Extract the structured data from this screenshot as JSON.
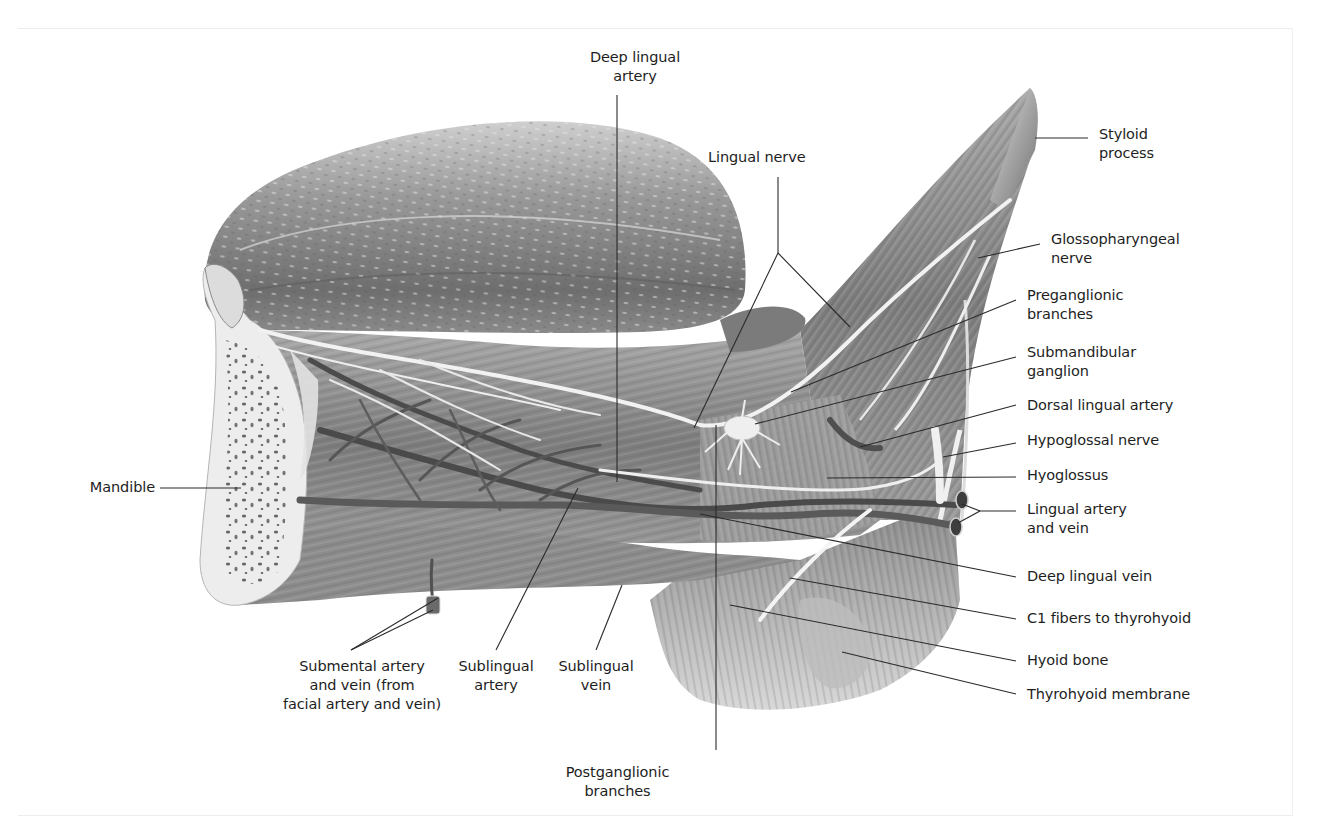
{
  "figure": {
    "colors": {
      "background": "#ffffff",
      "text": "#1e1e1e",
      "leader": "#2a2a2a"
    }
  },
  "labels": {
    "deep_lingual_artery": {
      "text": "Deep lingual\nartery",
      "x": 560,
      "y": 48,
      "align": "center",
      "w": 150
    },
    "lingual_nerve": {
      "text": "Lingual nerve",
      "x": 708,
      "y": 148,
      "align": "left",
      "w": 130
    },
    "styloid_process": {
      "text": "Styloid\nprocess",
      "x": 1099,
      "y": 125,
      "align": "left",
      "w": 120
    },
    "glossopharyngeal_nerve": {
      "text": "Glossopharyngeal\nnerve",
      "x": 1051,
      "y": 230,
      "align": "left",
      "w": 180
    },
    "preganglionic_branches": {
      "text": "Preganglionic\nbranches",
      "x": 1027,
      "y": 286,
      "align": "left",
      "w": 150
    },
    "submandibular_ganglion": {
      "text": "Submandibular\nganglion",
      "x": 1027,
      "y": 343,
      "align": "left",
      "w": 150
    },
    "dorsal_lingual_artery": {
      "text": "Dorsal lingual artery",
      "x": 1027,
      "y": 396,
      "align": "left",
      "w": 200
    },
    "hypoglossal_nerve": {
      "text": "Hypoglossal nerve",
      "x": 1027,
      "y": 431,
      "align": "left",
      "w": 200
    },
    "hyoglossus": {
      "text": "Hyoglossus",
      "x": 1027,
      "y": 466,
      "align": "left",
      "w": 150
    },
    "lingual_artery_vein": {
      "text": "Lingual artery\nand vein",
      "x": 1027,
      "y": 500,
      "align": "left",
      "w": 150
    },
    "deep_lingual_vein": {
      "text": "Deep lingual vein",
      "x": 1027,
      "y": 567,
      "align": "left",
      "w": 200
    },
    "c1_fibers": {
      "text": "C1 fibers to thyrohyoid",
      "x": 1027,
      "y": 609,
      "align": "left",
      "w": 220
    },
    "hyoid_bone": {
      "text": "Hyoid bone",
      "x": 1027,
      "y": 651,
      "align": "left",
      "w": 150
    },
    "thyrohyoid_membrane": {
      "text": "Thyrohyoid membrane",
      "x": 1027,
      "y": 685,
      "align": "left",
      "w": 220
    },
    "mandible": {
      "text": "Mandible",
      "x": 60,
      "y": 478,
      "align": "right",
      "w": 95
    },
    "submental_artery_vein": {
      "text": "Submental artery\nand vein (from\nfacial artery and vein)",
      "x": 262,
      "y": 657,
      "align": "center",
      "w": 200
    },
    "sublingual_artery": {
      "text": "Sublingual\nartery",
      "x": 446,
      "y": 657,
      "align": "center",
      "w": 100
    },
    "sublingual_vein": {
      "text": "Sublingual\nvein",
      "x": 546,
      "y": 657,
      "align": "center",
      "w": 100
    },
    "postganglionic_branches": {
      "text": "Postganglionic\nbranches",
      "x": 545,
      "y": 763,
      "align": "center",
      "w": 145
    }
  },
  "leaders": [
    {
      "name": "deep-lingual-artery-leader",
      "pts": [
        [
          617,
          95
        ],
        [
          617,
          482
        ]
      ]
    },
    {
      "name": "lingual-nerve-leader-stem",
      "pts": [
        [
          778,
          177
        ],
        [
          778,
          253
        ]
      ]
    },
    {
      "name": "lingual-nerve-leader-left",
      "pts": [
        [
          778,
          253
        ],
        [
          694,
          428
        ]
      ]
    },
    {
      "name": "lingual-nerve-leader-right",
      "pts": [
        [
          778,
          253
        ],
        [
          850,
          327
        ]
      ]
    },
    {
      "name": "styloid-process-leader",
      "pts": [
        [
          1088,
          138
        ],
        [
          1035,
          138
        ]
      ]
    },
    {
      "name": "glossopharyngeal-nerve-leader",
      "pts": [
        [
          1040,
          244
        ],
        [
          978,
          258
        ]
      ]
    },
    {
      "name": "preganglionic-branches-leader",
      "pts": [
        [
          1016,
          300
        ],
        [
          791,
          392
        ]
      ]
    },
    {
      "name": "submandibular-ganglion-leader",
      "pts": [
        [
          1016,
          357
        ],
        [
          755,
          424
        ]
      ]
    },
    {
      "name": "dorsal-lingual-artery-leader",
      "pts": [
        [
          1016,
          405
        ],
        [
          860,
          447
        ]
      ]
    },
    {
      "name": "hypoglossal-nerve-leader",
      "pts": [
        [
          1016,
          443
        ],
        [
          943,
          457
        ]
      ]
    },
    {
      "name": "hyoglossus-leader",
      "pts": [
        [
          1016,
          477
        ],
        [
          827,
          478
        ]
      ]
    },
    {
      "name": "lingual-artery-vein-leader-a",
      "pts": [
        [
          1016,
          511
        ],
        [
          980,
          511
        ]
      ]
    },
    {
      "name": "lingual-artery-vein-leader-b",
      "pts": [
        [
          980,
          511
        ],
        [
          962,
          504
        ]
      ]
    },
    {
      "name": "lingual-artery-vein-leader-c",
      "pts": [
        [
          980,
          511
        ],
        [
          958,
          523
        ]
      ]
    },
    {
      "name": "deep-lingual-vein-leader",
      "pts": [
        [
          1016,
          577
        ],
        [
          700,
          514
        ]
      ]
    },
    {
      "name": "c1-fibers-leader",
      "pts": [
        [
          1016,
          619
        ],
        [
          790,
          578
        ]
      ]
    },
    {
      "name": "hyoid-bone-leader",
      "pts": [
        [
          1016,
          661
        ],
        [
          730,
          605
        ]
      ]
    },
    {
      "name": "thyrohyoid-membrane-leader",
      "pts": [
        [
          1016,
          694
        ],
        [
          842,
          652
        ]
      ]
    },
    {
      "name": "mandible-leader",
      "pts": [
        [
          160,
          488
        ],
        [
          241,
          488
        ]
      ]
    },
    {
      "name": "submental-leader-a",
      "pts": [
        [
          351,
          650
        ],
        [
          433,
          610
        ]
      ]
    },
    {
      "name": "submental-leader-b",
      "pts": [
        [
          351,
          650
        ],
        [
          438,
          598
        ]
      ]
    },
    {
      "name": "sublingual-artery-leader",
      "pts": [
        [
          496,
          650
        ],
        [
          578,
          488
        ]
      ]
    },
    {
      "name": "sublingual-vein-leader",
      "pts": [
        [
          596,
          650
        ],
        [
          622,
          585
        ]
      ]
    },
    {
      "name": "postganglionic-branches-leader",
      "pts": [
        [
          716,
          750
        ],
        [
          716,
          425
        ]
      ]
    }
  ]
}
